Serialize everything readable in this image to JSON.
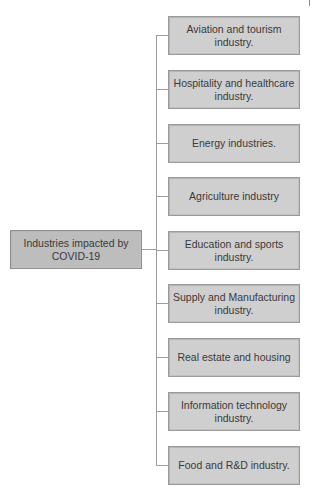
{
  "diagram": {
    "root": {
      "label": "Industries impacted by COVID-19"
    },
    "children": [
      {
        "label": "Aviation and tourism industry."
      },
      {
        "label": "Hospitality and healthcare industry."
      },
      {
        "label": "Energy industries."
      },
      {
        "label": "Agriculture industry"
      },
      {
        "label": "Education and sports industry."
      },
      {
        "label": "Supply and Manufacturing industry."
      },
      {
        "label": "Real estate and housing"
      },
      {
        "label": "Information technology industry."
      },
      {
        "label": "Food and R&D industry."
      }
    ],
    "colors": {
      "box_fill": "#cfcfcf",
      "root_fill": "#bdbdbd",
      "border": "#9a9a9a",
      "connector": "#9e9e9e",
      "text": "#3a3a3a"
    }
  }
}
